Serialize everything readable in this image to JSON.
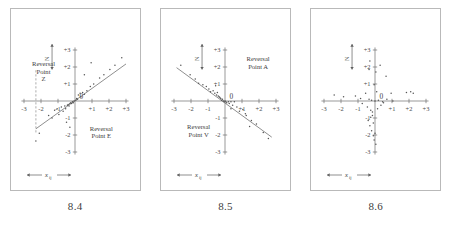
{
  "figure": {
    "panels": [
      {
        "caption": "8.4",
        "vertical_axis_indicator": "N",
        "horizontal_axis_label": "x",
        "horizontal_axis_label_subscript": "ij",
        "origin_label": "0",
        "x_ticks": [
          "-3",
          "-2",
          "-1",
          "+1",
          "+2",
          "+3"
        ],
        "y_ticks": [
          "+3",
          "+2",
          "+1",
          "-1",
          "-2",
          "-3"
        ],
        "annotations": [
          {
            "name": "reversal-point-z",
            "lines": [
              "Reversal",
              "Point",
              "Z"
            ]
          },
          {
            "name": "reversal-point-e",
            "lines": [
              "Reversal",
              "Point E"
            ]
          }
        ]
      },
      {
        "caption": "8.5",
        "vertical_axis_indicator": "N",
        "horizontal_axis_label": "x",
        "horizontal_axis_label_subscript": "ij",
        "origin_label": "0",
        "x_ticks": [
          "-3",
          "-2",
          "-1",
          "+1",
          "+2",
          "+3"
        ],
        "y_ticks": [
          "+3",
          "+2",
          "+1",
          "-1",
          "-2",
          "-3"
        ],
        "annotations": [
          {
            "name": "reversal-point-a",
            "lines": [
              "Reversal",
              "Point A"
            ]
          },
          {
            "name": "reversal-point-v",
            "lines": [
              "Reversal",
              "Point V"
            ]
          }
        ]
      },
      {
        "caption": "8.6",
        "vertical_axis_indicator": "N",
        "horizontal_axis_label": "x",
        "horizontal_axis_label_subscript": "ij",
        "origin_label": "0",
        "x_ticks": [
          "-3",
          "-2",
          "-1",
          "+1",
          "+2",
          "+3"
        ],
        "y_ticks": [
          "+3",
          "+2",
          "+1",
          "-1",
          "-2",
          "-3"
        ],
        "annotations": []
      }
    ]
  },
  "chart_data": [
    {
      "type": "scatter",
      "title": "8.4",
      "xlabel": "x_ij",
      "ylabel": "N",
      "xlim": [
        -3,
        3
      ],
      "ylim": [
        -3,
        3
      ],
      "grid": false,
      "legend": "none",
      "x": [
        -2.3,
        -2.1,
        -1.55,
        -1.35,
        -1.2,
        -1.05,
        -0.95,
        -0.8,
        -0.7,
        -0.6,
        -0.55,
        -0.45,
        -0.4,
        -0.35,
        -0.3,
        -0.25,
        -0.2,
        -0.15,
        -0.1,
        -0.05,
        0.05,
        0.1,
        0.15,
        0.2,
        0.3,
        0.35,
        0.45,
        0.55,
        0.7,
        0.9,
        1.1,
        1.45,
        1.7,
        2.05,
        2.35,
        2.75,
        0.55,
        0.95,
        -0.5,
        -0.3
      ],
      "y": [
        -2.35,
        -1.9,
        -0.85,
        -1.0,
        -0.55,
        -0.45,
        -0.8,
        -0.35,
        -0.6,
        -0.3,
        -0.45,
        -0.25,
        -0.2,
        -0.3,
        -0.15,
        -0.1,
        -0.15,
        -0.05,
        -0.1,
        0.0,
        0.05,
        0.15,
        0.1,
        0.35,
        0.45,
        0.25,
        0.5,
        0.4,
        0.6,
        0.85,
        1.0,
        1.35,
        1.55,
        1.85,
        2.1,
        2.55,
        1.55,
        2.25,
        -1.25,
        -1.55
      ],
      "regression_line": {
        "slope": 0.72,
        "intercept": 0.02,
        "x_start": -2.3,
        "x_end": 3.0
      },
      "reference_line": {
        "type": "dashed-vertical",
        "x": -2.3,
        "y_start": -1.85,
        "y_end": 1.85
      }
    },
    {
      "type": "scatter",
      "title": "8.5",
      "xlabel": "x_ij",
      "ylabel": "N",
      "xlim": [
        -3,
        3
      ],
      "ylim": [
        -3,
        3
      ],
      "grid": false,
      "legend": "none",
      "x": [
        -2.6,
        -2.05,
        -1.75,
        -1.55,
        -1.3,
        -1.1,
        -0.95,
        -0.85,
        -0.7,
        -0.6,
        -0.5,
        -0.45,
        -0.4,
        -0.35,
        -0.3,
        -0.25,
        -0.2,
        -0.15,
        -0.1,
        -0.05,
        0.0,
        0.05,
        0.1,
        0.2,
        0.25,
        0.35,
        0.45,
        0.55,
        0.7,
        0.85,
        1.05,
        1.25,
        1.55,
        1.85,
        2.25,
        2.55,
        1.2,
        0.35,
        -0.55,
        1.45
      ],
      "y": [
        2.1,
        1.55,
        1.3,
        1.05,
        0.95,
        0.85,
        0.7,
        0.55,
        0.6,
        0.45,
        0.35,
        0.5,
        0.3,
        0.25,
        0.2,
        0.15,
        0.05,
        0.1,
        0.0,
        -0.05,
        0.0,
        -0.05,
        -0.1,
        -0.05,
        -0.15,
        -0.05,
        -0.25,
        -0.05,
        -0.35,
        -0.6,
        -0.5,
        -0.85,
        -1.15,
        -1.35,
        -1.85,
        -2.2,
        -0.75,
        -0.45,
        0.9,
        -1.5
      ],
      "regression_line": {
        "slope": -0.73,
        "intercept": -0.12,
        "x_start": -2.85,
        "x_end": 2.75
      }
    },
    {
      "type": "scatter",
      "title": "8.6",
      "xlabel": "x_ij",
      "ylabel": "N",
      "xlim": [
        -3,
        3
      ],
      "ylim": [
        -3,
        3
      ],
      "grid": false,
      "legend": "none",
      "x": [
        -0.3,
        -0.35,
        0.3,
        0.65,
        0.05,
        -0.05,
        0.1,
        0.95,
        1.85,
        2.1,
        2.25,
        -2.4,
        -1.85,
        -1.15,
        -0.85,
        -0.55,
        -0.35,
        -0.2,
        0.0,
        0.2,
        0.45,
        0.7,
        1.05,
        -0.75,
        -0.45,
        -0.25,
        -0.15,
        0.15,
        0.35,
        0.5,
        -0.4,
        -0.3,
        -0.2,
        -0.1,
        -0.05,
        0.05,
        -0.15,
        -0.25,
        -0.1,
        0.0
      ],
      "y": [
        2.35,
        1.85,
        2.1,
        1.45,
        1.7,
        0.95,
        0.55,
        0.45,
        0.5,
        0.55,
        0.45,
        0.35,
        0.25,
        0.3,
        0.15,
        0.45,
        0.1,
        0.05,
        0.0,
        0.05,
        -0.05,
        0.1,
        0.0,
        -0.15,
        -0.35,
        -0.55,
        -0.85,
        -0.45,
        -0.25,
        -0.1,
        -1.15,
        -1.45,
        -1.75,
        -2.05,
        -2.3,
        -2.55,
        -0.65,
        -0.95,
        -1.3,
        -1.9
      ],
      "regression_line": null
    }
  ]
}
